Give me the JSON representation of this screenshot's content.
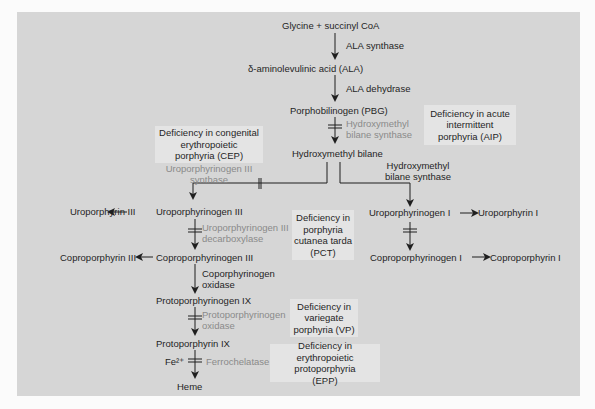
{
  "diagram": {
    "colors": {
      "panel_bg": "#d6d6d6",
      "deficiency_box_bg": "#e4e4e4",
      "text": "#1f1f1f",
      "blocked_enzyme_text": "#8a8a8a"
    },
    "intermediates": {
      "glycine_succinyl": "Glycine + succinyl CoA",
      "ala": "δ-aminolevulinic acid (ALA)",
      "pbg": "Porphobilinogen (PBG)",
      "hmb": "Hydroxymethyl bilane",
      "uro3": "Uroporphyrinogen III",
      "uro1": "Uroporphyrinogen I",
      "copro3": "Coproporphyrinogen III",
      "copro1": "Coproporphyrinogen I",
      "protogen9": "Protoporphyrinogen IX",
      "proto9": "Protoporphyrin IX",
      "heme": "Heme",
      "fe": "Fe²⁺"
    },
    "side_products": {
      "uroporphyrin3": "Uroporphyrin III",
      "coproporphyrin3": "Coproporphyrin III",
      "uroporphyrin1": "Uroporphyrin I",
      "coproporphyrin1": "Coproporphyrin I"
    },
    "enzymes": {
      "ala_synthase": "ALA synthase",
      "ala_dehydrase": "ALA dehydrase",
      "hmb_synthase_blocked_line1": "Hydroxymethyl",
      "hmb_synthase_blocked_line2": "bilane synthase",
      "hmb_synthase_line1": "Hydroxymethyl",
      "hmb_synthase_line2": "bilane synthase",
      "uro3_synthase_line1": "Uroporphyrinogen III",
      "uro3_synthase_line2": "synthase",
      "uro_decarboxylase_line1": "Uroporphyrinogen III",
      "uro_decarboxylase_line2": "decarboxylase",
      "copro_oxidase_line1": "Coporphyrinogen",
      "copro_oxidase_line2": "oxidase",
      "protogen_oxidase_line1": "Protoporphyrinogen",
      "protogen_oxidase_line2": "oxidase",
      "ferrochelatase": "Ferrochelatase"
    },
    "deficiencies": {
      "aip": [
        "Deficiency in acute",
        "intermittent",
        "porphyria (AIP)"
      ],
      "cep": [
        "Deficiency in congenital",
        "erythropoietic",
        "porphyria (CEP)"
      ],
      "pct": [
        "Deficiency in",
        "porphyria",
        "cutanea tarda",
        "(PCT)"
      ],
      "vp": [
        "Deficiency in",
        "variegate",
        "porphyria (VP)"
      ],
      "epp": [
        "Deficiency in erythropoietic",
        "protoporphyria",
        "(EPP)"
      ]
    }
  }
}
